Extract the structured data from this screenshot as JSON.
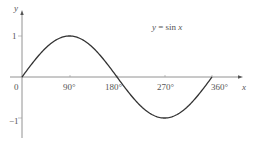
{
  "chart_data": {
    "type": "line",
    "title": "",
    "annotation": "y = sin x",
    "xlabel": "x",
    "ylabel": "y",
    "x_ticks": [
      "90°",
      "180°",
      "270°",
      "360°"
    ],
    "y_ticks": [
      "1",
      "−1"
    ],
    "origin_label": "0",
    "xlim": [
      0,
      360
    ],
    "ylim": [
      -1,
      1
    ],
    "grid": false,
    "series": [
      {
        "name": "y = sin x",
        "x": [
          0,
          30,
          60,
          90,
          120,
          150,
          180,
          210,
          240,
          270,
          300,
          330,
          360
        ],
        "values": [
          0,
          0.5,
          0.866,
          1,
          0.866,
          0.5,
          0,
          -0.5,
          -0.866,
          -1,
          -0.866,
          -0.5,
          0
        ]
      }
    ]
  },
  "labels": {
    "y_axis": "y",
    "x_axis": "x",
    "origin": "0",
    "y_one": "1",
    "y_minus_one": "−1",
    "tick_90": "90°",
    "tick_180": "180°",
    "tick_270": "270°",
    "tick_360": "360°",
    "equation_y": "y",
    "equation_eq": " = sin ",
    "equation_x": "x"
  },
  "colors": {
    "axis": "#666666",
    "curve": "#333333",
    "text": "#555555"
  }
}
